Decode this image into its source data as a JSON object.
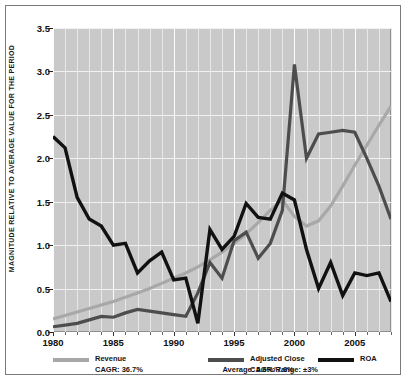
{
  "chart_data": {
    "type": "line",
    "title": "",
    "xlabel": "",
    "ylabel": "MAGNITUDE RELATIVE TO AVERAGE VALUE FOR THE PERIOD",
    "xlim": [
      1980,
      2008
    ],
    "ylim": [
      0.0,
      3.5
    ],
    "grid": true,
    "legend_position": "bottom",
    "yticks": [
      "0.0",
      "0.5",
      "1.0",
      "1.5",
      "2.0",
      "2.5",
      "3.0",
      "3.5"
    ],
    "ytick_values": [
      0.0,
      0.5,
      1.0,
      1.5,
      2.0,
      2.5,
      3.0,
      3.5
    ],
    "xticks": [
      "1980",
      "1985",
      "1990",
      "1995",
      "2000",
      "2005"
    ],
    "xtick_values": [
      1980,
      1985,
      1990,
      1995,
      2000,
      2005
    ],
    "x": [
      1980,
      1981,
      1982,
      1983,
      1984,
      1985,
      1986,
      1987,
      1988,
      1989,
      1990,
      1991,
      1992,
      1993,
      1994,
      1995,
      1996,
      1997,
      1998,
      1999,
      2000,
      2001,
      2002,
      2003,
      2004,
      2005,
      2006,
      2007,
      2008
    ],
    "series": [
      {
        "name": "Revenue",
        "color": "#a8a8a8",
        "annotation": "CAGR: 36.7%",
        "values": [
          0.15,
          0.19,
          0.23,
          0.27,
          0.31,
          0.35,
          0.4,
          0.45,
          0.5,
          0.56,
          0.62,
          0.68,
          0.75,
          0.83,
          0.92,
          1.02,
          1.13,
          1.26,
          1.4,
          1.52,
          1.33,
          1.22,
          1.28,
          1.45,
          1.68,
          1.92,
          2.15,
          2.38,
          2.6
        ]
      },
      {
        "name": "Adjusted Close",
        "color": "#4d4d4d",
        "annotation": "CAGR: 7.8%",
        "values": [
          0.06,
          0.08,
          0.1,
          0.14,
          0.18,
          0.17,
          0.22,
          0.26,
          0.24,
          0.22,
          0.2,
          0.18,
          0.45,
          0.8,
          0.62,
          1.05,
          1.15,
          0.85,
          1.02,
          1.4,
          3.08,
          2.0,
          2.28,
          2.3,
          2.32,
          2.3,
          2.0,
          1.68,
          1.3
        ]
      },
      {
        "name": "ROA",
        "color": "#111111",
        "annotation": "Average: 5.6%/Range: ±3%",
        "values": [
          2.25,
          2.12,
          1.55,
          1.3,
          1.22,
          1.0,
          1.02,
          0.68,
          0.82,
          0.92,
          0.6,
          0.62,
          0.1,
          1.18,
          0.95,
          1.1,
          1.48,
          1.32,
          1.3,
          1.6,
          1.52,
          0.95,
          0.5,
          0.8,
          0.42,
          0.68,
          0.65,
          0.68,
          0.35
        ]
      }
    ]
  },
  "legend": {
    "items": [
      {
        "label": "Revenue",
        "sub": "CAGR: 36.7%"
      },
      {
        "label": "Adjusted Close",
        "sub": "CAGR: 7.8%"
      },
      {
        "label": "ROA",
        "sub": "Average: 5.6%/Range: ±3%"
      }
    ]
  }
}
